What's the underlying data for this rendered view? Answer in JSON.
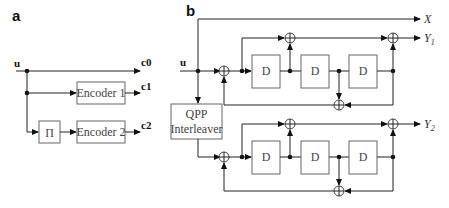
{
  "panel_a": {
    "label": "a",
    "input": "u",
    "outputs": [
      "c0",
      "c1",
      "c2"
    ],
    "interleaver": "Π",
    "encoder1": "Encoder 1",
    "encoder2": "Encoder 2"
  },
  "panel_b": {
    "label": "b",
    "input": "u",
    "interleaver_line1": "QPP",
    "interleaver_line2": "Interleaver",
    "delay": "D",
    "outputs": {
      "x": "X",
      "y1": "Y",
      "y1_sub": "1",
      "y2": "Y",
      "y2_sub": "2"
    }
  }
}
